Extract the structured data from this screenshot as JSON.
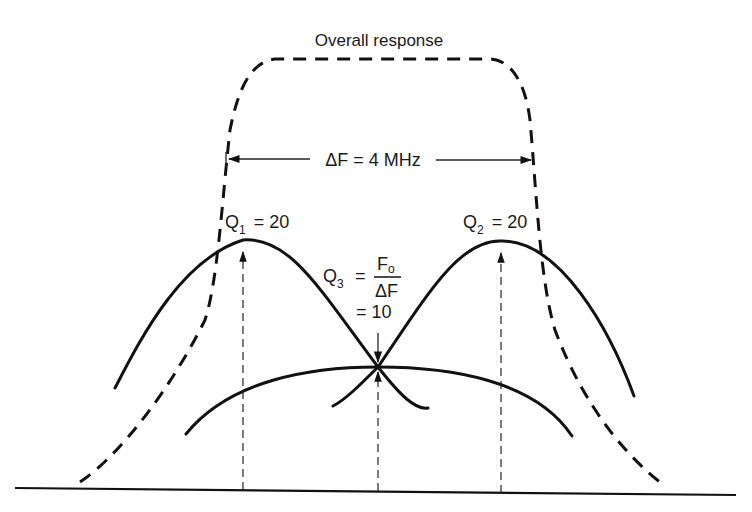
{
  "diagram": {
    "title": "Overall response",
    "bandwidth_label": "ΔF = 4 MHz",
    "q1": {
      "symbol": "Q",
      "subscript": "1",
      "value_text": "= 20"
    },
    "q2": {
      "symbol": "Q",
      "subscript": "2",
      "value_text": "= 20"
    },
    "q3": {
      "symbol": "Q",
      "subscript": "3",
      "equals": "=",
      "numerator": "F",
      "numerator_subscript": "o",
      "denominator": "ΔF",
      "value_text": "= 10"
    },
    "curves": [
      {
        "name": "overall-response",
        "style": "dashed-heavy"
      },
      {
        "name": "stage-1-response",
        "style": "solid",
        "Q": 20
      },
      {
        "name": "stage-2-response",
        "style": "solid",
        "Q": 20
      },
      {
        "name": "stage-3-response",
        "style": "solid",
        "Q": 10
      }
    ],
    "colors": {
      "ink": "#111111",
      "background": "#ffffff"
    }
  }
}
